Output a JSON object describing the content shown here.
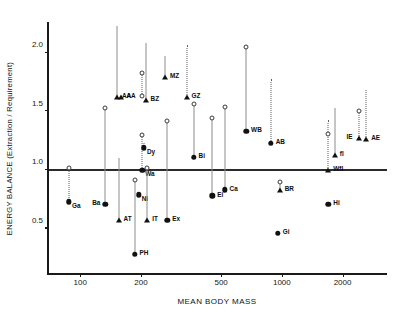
{
  "chart_data": {
    "type": "scatter",
    "title": "",
    "xlabel": "MEAN BODY MASS",
    "ylabel": "ENERGY BALANCE (Extraction / Requirement)",
    "xscale": "log",
    "xlim": [
      70,
      3400
    ],
    "ylim": [
      0.12,
      2.28
    ],
    "xticks": [
      100,
      200,
      500,
      1000,
      2000
    ],
    "xtick_labels": [
      "100",
      "200",
      "500",
      "1000",
      "2000"
    ],
    "yticks": [
      0.5,
      1.0,
      1.5,
      2.0
    ],
    "ytick_labels": [
      "0.5",
      "1.0",
      "1.5",
      "2.0"
    ],
    "grid": false,
    "legend": "none",
    "reference_line": {
      "y": 1.0,
      "label": "unity-energy-balance"
    },
    "marker_types": {
      "dot-filled": "filled circle - primary estimate",
      "dot-open": "open circle - upper estimate",
      "tri-filled": "filled triangle - primary estimate",
      "tri-open": "open triangle - upper estimate"
    },
    "points": [
      {
        "label": "Ga",
        "x": 88,
        "y": 0.73,
        "marker": "dot-filled",
        "upper": 1.02,
        "upper_marker": "dot-open",
        "connector": "dotted",
        "lx": 3,
        "ly": 7
      },
      {
        "label": "Ba",
        "x": 133,
        "y": 0.71,
        "marker": "dot-filled",
        "upper": 1.53,
        "upper_marker": "dot-open",
        "connector": "solid",
        "lx": -13,
        "ly": 2
      },
      {
        "label": "AA",
        "x": 152,
        "y": 1.62,
        "marker": "tri-filled",
        "upper": 2.23,
        "upper_marker": "tri-open",
        "connector": "solid",
        "lx": 5,
        "ly": 2
      },
      {
        "label": "AA2",
        "x": 160,
        "y": 1.62,
        "marker": "tri-filled",
        "upper": null,
        "upper_marker": null,
        "connector": "none",
        "lx": 5,
        "ly": 2
      },
      {
        "label": "AT",
        "x": 155,
        "y": 0.57,
        "marker": "tri-filled",
        "upper": 1.1,
        "upper_marker": "tri-open",
        "connector": "solid",
        "lx": 5,
        "ly": 2
      },
      {
        "label": "PH",
        "x": 186,
        "y": 0.28,
        "marker": "dot-filled",
        "upper": 0.91,
        "upper_marker": "dot-open",
        "connector": "solid",
        "lx": 5,
        "ly": 2
      },
      {
        "label": "Ni",
        "x": 195,
        "y": 0.79,
        "marker": "dot-filled",
        "upper": null,
        "upper_marker": null,
        "connector": "none",
        "lx": 3,
        "ly": 7
      },
      {
        "label": "Wa",
        "x": 203,
        "y": 1.0,
        "marker": "dot-filled",
        "upper": 1.3,
        "upper_marker": "dot-open",
        "connector": "dotted",
        "lx": 3,
        "ly": 7
      },
      {
        "label": "Dy",
        "x": 207,
        "y": 1.19,
        "marker": "dot-filled",
        "upper": 1.23,
        "upper_marker": "tri-open",
        "connector": "dotted",
        "lx": 3,
        "ly": 7
      },
      {
        "label": "BZ",
        "x": 211,
        "y": 1.6,
        "marker": "tri-filled",
        "upper": 2.08,
        "upper_marker": "tri-open",
        "connector": "solid",
        "lx": 5,
        "ly": 2
      },
      {
        "label": "BZ2",
        "x": 203,
        "y": 1.63,
        "marker": "dot-open",
        "upper": 1.83,
        "upper_marker": "dot-open",
        "connector": "dotted",
        "lx": 99,
        "ly": 99
      },
      {
        "label": "IT",
        "x": 215,
        "y": 0.57,
        "marker": "tri-filled",
        "upper": 1.02,
        "upper_marker": "dot-open",
        "connector": "solid",
        "lx": 5,
        "ly": 2
      },
      {
        "label": "MZ",
        "x": 263,
        "y": 1.79,
        "marker": "tri-filled",
        "upper": 1.97,
        "upper_marker": "tri-open",
        "connector": "solid",
        "lx": 5,
        "ly": 2
      },
      {
        "label": "Ex",
        "x": 270,
        "y": 0.57,
        "marker": "dot-filled",
        "upper": 1.42,
        "upper_marker": "dot-open",
        "connector": "solid",
        "lx": 5,
        "ly": 2
      },
      {
        "label": "GZ",
        "x": 337,
        "y": 1.62,
        "marker": "tri-filled",
        "upper": 2.07,
        "upper_marker": "tri-open",
        "connector": "dotted",
        "lx": 5,
        "ly": 2
      },
      {
        "label": "Bi",
        "x": 365,
        "y": 1.11,
        "marker": "dot-filled",
        "upper": 1.56,
        "upper_marker": "dot-open",
        "connector": "solid",
        "lx": 5,
        "ly": 2
      },
      {
        "label": "Ei",
        "x": 452,
        "y": 0.78,
        "marker": "dot-filled",
        "upper": 1.44,
        "upper_marker": "dot-open",
        "connector": "solid",
        "lx": 5,
        "ly": 2
      },
      {
        "label": "Ca",
        "x": 520,
        "y": 0.83,
        "marker": "dot-filled",
        "upper": 1.54,
        "upper_marker": "dot-open",
        "connector": "solid",
        "lx": 5,
        "ly": 2
      },
      {
        "label": "WB",
        "x": 665,
        "y": 1.33,
        "marker": "dot-filled",
        "upper": 2.05,
        "upper_marker": "dot-open",
        "connector": "solid",
        "lx": 5,
        "ly": 2
      },
      {
        "label": "AB",
        "x": 880,
        "y": 1.23,
        "marker": "dot-filled",
        "upper": 1.78,
        "upper_marker": "tri-open",
        "connector": "dotted",
        "lx": 5,
        "ly": 2
      },
      {
        "label": "BR",
        "x": 975,
        "y": 0.83,
        "marker": "tri-filled",
        "upper": 0.9,
        "upper_marker": "dot-open",
        "connector": "solid",
        "lx": 5,
        "ly": 2
      },
      {
        "label": "Gi",
        "x": 955,
        "y": 0.46,
        "marker": "dot-filled",
        "upper": null,
        "upper_marker": null,
        "connector": "none",
        "lx": 5,
        "ly": 2
      },
      {
        "label": "Hi",
        "x": 1700,
        "y": 0.71,
        "marker": "dot-filled",
        "upper": null,
        "upper_marker": null,
        "connector": "none",
        "lx": 5,
        "ly": 2
      },
      {
        "label": "Wfl",
        "x": 1700,
        "y": 1.0,
        "marker": "tri-filled",
        "upper": 1.43,
        "upper_marker": "tri-open",
        "connector": "dotted",
        "lx": 5,
        "ly": 2
      },
      {
        "label": "Wfl2",
        "x": 1690,
        "y": 1.31,
        "marker": "dot-open",
        "upper": null,
        "upper_marker": null,
        "connector": "none",
        "lx": 99,
        "ly": 99
      },
      {
        "label": "fl",
        "x": 1830,
        "y": 1.13,
        "marker": "tri-filled",
        "upper": 1.53,
        "upper_marker": "tri-open",
        "connector": "solid",
        "lx": 5,
        "ly": 2
      },
      {
        "label": "IE",
        "x": 2400,
        "y": 1.27,
        "marker": "tri-filled",
        "upper": 1.5,
        "upper_marker": "dot-open",
        "connector": "dotted",
        "lx": -12,
        "ly": 2
      },
      {
        "label": "AE",
        "x": 2620,
        "y": 1.26,
        "marker": "tri-filled",
        "upper": 1.68,
        "upper_marker": "tri-open",
        "connector": "dotted",
        "lx": 5,
        "ly": 2
      }
    ]
  }
}
